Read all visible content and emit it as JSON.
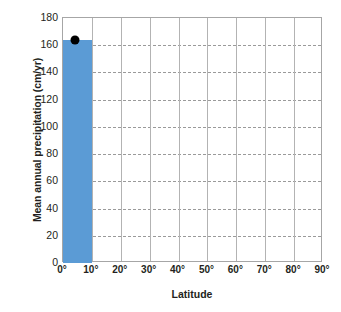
{
  "chart_data": {
    "type": "bar",
    "title": "",
    "xlabel": "Latitude",
    "ylabel": "Mean annual precipitation (cm/yr)",
    "categories": [
      "0°–10°",
      "10°–20°",
      "20°–30°",
      "30°–40°",
      "40°–50°",
      "50°–60°",
      "60°–70°",
      "70°–80°",
      "80°–90°"
    ],
    "values": [
      164,
      0,
      0,
      0,
      0,
      0,
      0,
      0,
      0
    ],
    "xlim": [
      0,
      90
    ],
    "ylim": [
      0,
      180
    ],
    "x_ticks": [
      0,
      10,
      20,
      30,
      40,
      50,
      60,
      70,
      80,
      90
    ],
    "x_tick_labels": [
      "0°",
      "10°",
      "20°",
      "30°",
      "40°",
      "50°",
      "60°",
      "70°",
      "80°",
      "90°"
    ],
    "y_ticks": [
      0,
      20,
      40,
      60,
      80,
      100,
      120,
      140,
      160,
      180
    ],
    "y_tick_labels": [
      "0",
      "20",
      "40",
      "60",
      "80",
      "100",
      "120",
      "140",
      "160",
      "180"
    ],
    "grid": {
      "horizontal": true,
      "horizontal_style": "dashed",
      "vertical": true,
      "vertical_style": "solid"
    },
    "legend": {
      "visible": false,
      "position": "none"
    },
    "bar_color": "#5b9bd5",
    "grid_color": "#9a9a9a",
    "frame_color": "#a6a6a6",
    "text_color": "#231f20",
    "markers": [
      {
        "name": "data-point-marker",
        "x": 4,
        "y": 164,
        "color": "#000000",
        "shape": "circle"
      }
    ]
  }
}
